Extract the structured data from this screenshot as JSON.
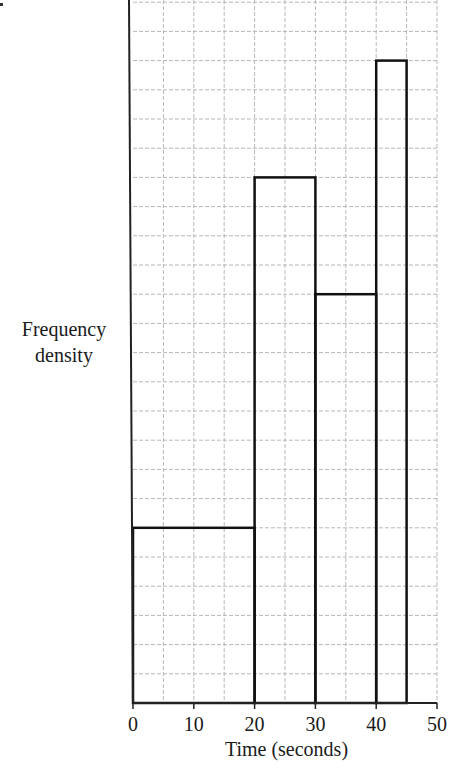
{
  "chart_data": {
    "type": "bar",
    "subtype": "histogram",
    "title": "",
    "xlabel": "Time (seconds)",
    "ylabel": "Frequency density",
    "x_ticks": [
      0,
      10,
      20,
      30,
      40,
      50
    ],
    "xlim": [
      0,
      50
    ],
    "ylim_grid_units": [
      0,
      24
    ],
    "y_tick_labels": [],
    "grid": true,
    "grid_x_step": 5,
    "grid_y_step": 1,
    "bins": [
      {
        "start": 0,
        "end": 20,
        "height": 6
      },
      {
        "start": 20,
        "end": 30,
        "height": 18
      },
      {
        "start": 30,
        "end": 40,
        "height": 14
      },
      {
        "start": 40,
        "end": 45,
        "height": 22
      }
    ],
    "categories": [
      "0-20",
      "20-30",
      "30-40",
      "40-45"
    ],
    "values": [
      6,
      18,
      14,
      22
    ],
    "note": "Y-axis has no numeric scale; heights are in grid squares"
  },
  "labels": {
    "ylabel_line1": "Frequency",
    "ylabel_line2": "density",
    "xlabel": "Time (seconds)"
  },
  "colors": {
    "bar_stroke": "#111111",
    "grid": "#b8b8b8",
    "axis": "#222222"
  }
}
